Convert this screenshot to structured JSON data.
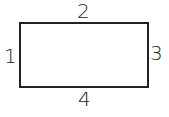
{
  "diagram": {
    "shape": "rectangle",
    "labels": {
      "left": "1",
      "top": "2",
      "right": "3",
      "bottom": "4"
    },
    "stroke_color": "#222222",
    "background": "#ffffff"
  }
}
